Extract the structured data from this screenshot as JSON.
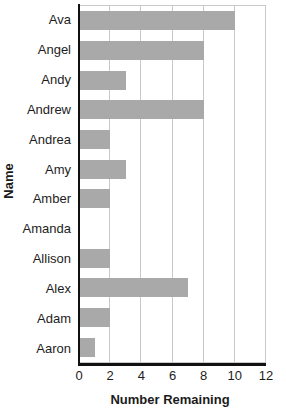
{
  "chart_data": {
    "type": "bar",
    "orientation": "horizontal",
    "title": "",
    "xlabel": "Number Remaining",
    "ylabel": "Name",
    "categories": [
      "Ava",
      "Angel",
      "Andy",
      "Andrew",
      "Andrea",
      "Amy",
      "Amber",
      "Amanda",
      "Allison",
      "Alex",
      "Adam",
      "Aaron"
    ],
    "values": [
      10,
      8,
      3,
      8,
      2,
      3,
      2,
      0,
      2,
      7,
      2,
      1
    ],
    "xlim": [
      0,
      12
    ],
    "xticks": [
      0,
      2,
      4,
      6,
      8,
      10,
      12
    ],
    "xtick_labels": [
      "0",
      "2",
      "4",
      "6",
      "8",
      "10",
      "12"
    ],
    "grid": "vertical",
    "legend": "none",
    "bar_color": "#a9a9a9",
    "gridline_color": "#c9c9c9",
    "axis_color": "#111111"
  }
}
